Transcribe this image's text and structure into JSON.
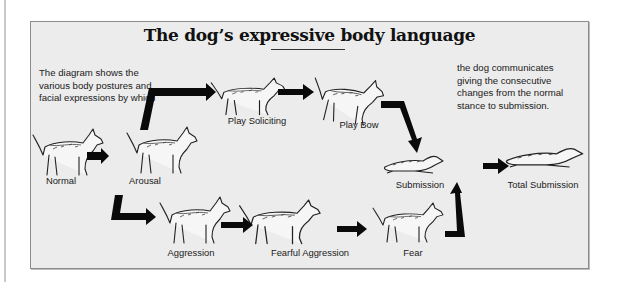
{
  "diagram": {
    "title": "The dog’s expressive body language",
    "intro_left": "The diagram shows the various body postures and facial expressions by which",
    "intro_right": "the dog communicates giving the consecutive changes from the normal stance to submission.",
    "stages": [
      {
        "id": "normal",
        "label": "Normal"
      },
      {
        "id": "arousal",
        "label": "Arousal"
      },
      {
        "id": "play-soliciting",
        "label": "Play Soliciting"
      },
      {
        "id": "play-bow",
        "label": "Play Bow"
      },
      {
        "id": "submission",
        "label": "Submission"
      },
      {
        "id": "total-submission",
        "label": "Total Submission"
      },
      {
        "id": "aggression",
        "label": "Aggression"
      },
      {
        "id": "fearful-aggression",
        "label": "Fearful Aggression"
      },
      {
        "id": "fear",
        "label": "Fear"
      }
    ],
    "transitions": [
      {
        "from": "normal",
        "to": "arousal"
      },
      {
        "from": "arousal",
        "to": "play-soliciting"
      },
      {
        "from": "play-soliciting",
        "to": "play-bow"
      },
      {
        "from": "play-bow",
        "to": "submission"
      },
      {
        "from": "submission",
        "to": "total-submission"
      },
      {
        "from": "arousal",
        "to": "aggression"
      },
      {
        "from": "aggression",
        "to": "fearful-aggression"
      },
      {
        "from": "fearful-aggression",
        "to": "fear"
      },
      {
        "from": "fear",
        "to": "submission"
      }
    ],
    "colors": {
      "panel_bg": "#ececec",
      "arrow": "#0a0a0a",
      "ink": "#1a1a1a"
    }
  }
}
